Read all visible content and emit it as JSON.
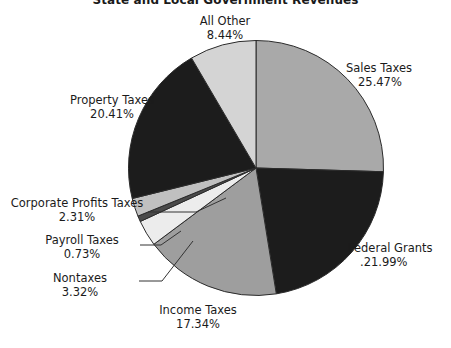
{
  "chart": {
    "title": "State and Local Government Revenues"
  },
  "chart_data": {
    "type": "pie",
    "title": "State and Local Government Revenues",
    "xlabel": "",
    "ylabel": "",
    "legend": "none",
    "grid": false,
    "units": "percent",
    "start_angle_deg": 0,
    "direction": "clockwise",
    "categories": [
      "Sales Taxes",
      "Federal Grants",
      "Income Taxes",
      "Nontaxes",
      "Payroll Taxes",
      "Corporate Profits Taxes",
      "Property Taxes",
      "All Other"
    ],
    "values": [
      25.47,
      21.99,
      17.34,
      3.32,
      0.73,
      2.31,
      20.41,
      8.44
    ],
    "colors": [
      "#a9a9a9",
      "#1c1c1c",
      "#9e9e9e",
      "#ececec",
      "#4a4a4a",
      "#c0c0c0",
      "#1c1c1c",
      "#d4d4d4"
    ],
    "slices": [
      {
        "label": "Sales Taxes",
        "value": 25.47,
        "value_text": "25.47%",
        "color": "#a9a9a9"
      },
      {
        "label": "Federal Grants",
        "value": 21.99,
        "value_text": "21.99%",
        "color": "#1c1c1c"
      },
      {
        "label": "Income Taxes",
        "value": 17.34,
        "value_text": "17.34%",
        "color": "#9e9e9e"
      },
      {
        "label": "Nontaxes",
        "value": 3.32,
        "value_text": "3.32%",
        "color": "#ececec"
      },
      {
        "label": "Payroll Taxes",
        "value": 0.73,
        "value_text": "0.73%",
        "color": "#4a4a4a"
      },
      {
        "label": "Corporate Profits Taxes",
        "value": 2.31,
        "value_text": "2.31%",
        "color": "#c0c0c0"
      },
      {
        "label": "Property Taxes",
        "value": 20.41,
        "value_text": "20.41%",
        "color": "#1c1c1c"
      },
      {
        "label": "All Other",
        "value": 8.44,
        "value_text": "8.44%",
        "color": "#d4d4d4"
      }
    ]
  },
  "labels": {
    "sales_taxes": {
      "name": "Sales Taxes",
      "pct": "25.47%"
    },
    "federal": {
      "name": "Federal Grants",
      "pct": ".21.99%"
    },
    "income": {
      "name": "Income Taxes",
      "pct": "17.34%"
    },
    "nontaxes": {
      "name": "Nontaxes",
      "pct": "3.32%"
    },
    "payroll": {
      "name": "Payroll Taxes",
      "pct": "0.73%"
    },
    "corporate": {
      "name": "Corporate Profits Taxes",
      "pct": "2.31%"
    },
    "property": {
      "name": "Property Taxes",
      "pct": "20.41%"
    },
    "all_other": {
      "name": "All Other",
      "pct": "8.44%"
    }
  }
}
